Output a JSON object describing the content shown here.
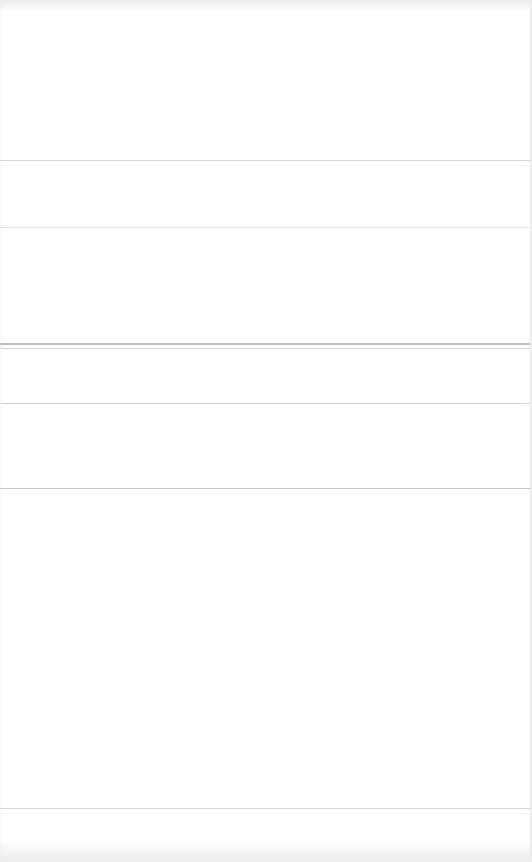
{
  "page": {
    "background": "#ffffff",
    "rule_color": "#d6d6d6",
    "sections": [
      {
        "id": "section-1",
        "top": 0,
        "height": 160,
        "text": ""
      },
      {
        "id": "section-2",
        "top": 161,
        "height": 66,
        "text": ""
      },
      {
        "id": "section-3",
        "top": 228,
        "height": 116,
        "text": ""
      },
      {
        "id": "section-4",
        "top": 349,
        "height": 54,
        "text": ""
      },
      {
        "id": "section-5",
        "top": 404,
        "height": 84,
        "text": ""
      },
      {
        "id": "section-6",
        "top": 489,
        "height": 319,
        "text": ""
      },
      {
        "id": "section-7",
        "top": 809,
        "height": 53,
        "text": ""
      }
    ]
  }
}
